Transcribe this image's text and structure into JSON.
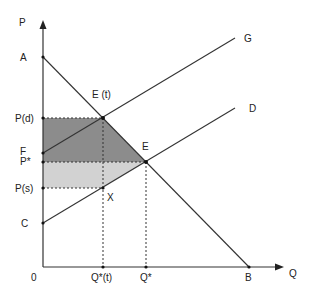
{
  "diagram": {
    "type": "supply-demand-tax",
    "axes": {
      "y_label": "P",
      "x_label": "Q",
      "origin_label": "0"
    },
    "price_labels": {
      "A": "A",
      "Pd": "P(d)",
      "F": "F",
      "Pstar": "P*",
      "Ps": "P(s)",
      "C": "C"
    },
    "quantity_labels": {
      "Qt": "Q*(t)",
      "Qstar": "Q*",
      "B": "B"
    },
    "point_labels": {
      "Et": "E (t)",
      "E": "E",
      "X": "X"
    },
    "curve_labels": {
      "taxed_supply": "G",
      "supply": "D"
    },
    "colors": {
      "line": "#333333",
      "consumer_tax_area": "#8c8c8c",
      "producer_tax_area": "#d2d2d2",
      "background": "#ffffff"
    }
  }
}
